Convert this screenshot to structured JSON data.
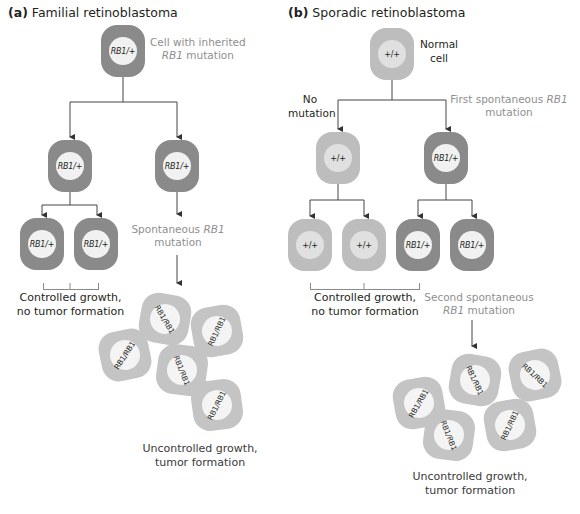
{
  "panel_a": {
    "title_prefix": "(a)",
    "title": "Familial retinoblastoma",
    "top_cell": {
      "genotype": "RB1/+",
      "label_line1": "Cell with inherited",
      "label_line2_italic": "RB1",
      "label_line2_rest": " mutation"
    },
    "gen2_cells": [
      {
        "genotype": "RB1/+"
      },
      {
        "genotype": "RB1/+"
      }
    ],
    "gen3_cells": [
      {
        "genotype": "RB1/+"
      },
      {
        "genotype": "RB1/+"
      }
    ],
    "spontaneous_label": {
      "line1_prefix": "Spontaneous ",
      "line1_italic": "RB1",
      "line2": "mutation"
    },
    "controlled_label": {
      "line1": "Controlled growth,",
      "line2": "no tumor formation"
    },
    "tumor_cells": [
      "RB1/RB1",
      "RB1/RB1",
      "RB1/RB1",
      "RB1/RB1",
      "RB1/RB1"
    ],
    "uncontrolled_label": {
      "line1": "Uncontrolled growth,",
      "line2": "tumor formation"
    }
  },
  "panel_b": {
    "title_prefix": "(b)",
    "title": "Sporadic retinoblastoma",
    "top_cell": {
      "genotype": "+/+",
      "label_line1": "Normal",
      "label_line2": "cell"
    },
    "no_mutation_label": {
      "line1": "No",
      "line2": "mutation"
    },
    "first_mutation_label": {
      "line1_prefix": "First spontaneous ",
      "line1_italic": "RB1",
      "line2": "mutation"
    },
    "gen2_cells": [
      {
        "genotype": "+/+"
      },
      {
        "genotype": "RB1/+"
      }
    ],
    "gen3_cells": [
      {
        "genotype": "+/+"
      },
      {
        "genotype": "+/+"
      },
      {
        "genotype": "RB1/+"
      },
      {
        "genotype": "RB1/+"
      }
    ],
    "controlled_label": {
      "line1": "Controlled growth,",
      "line2": "no tumor formation"
    },
    "second_mutation_label": {
      "line1": "Second spontaneous",
      "line2_italic": "RB1",
      "line2_rest": " mutation"
    },
    "tumor_cells": [
      "RB1/RB1",
      "RB1/RB1",
      "RB1/RB1",
      "RB1/RB1",
      "RB1/RB1"
    ],
    "uncontrolled_label": {
      "line1": "Uncontrolled growth,",
      "line2": "tumor formation"
    }
  },
  "colors": {
    "mutant_cell": "#8a8a8a",
    "normal_cell": "#bdbdbd",
    "tumor_cell": "#c4c4c4",
    "annotation_gray": "#8f8f8f"
  }
}
